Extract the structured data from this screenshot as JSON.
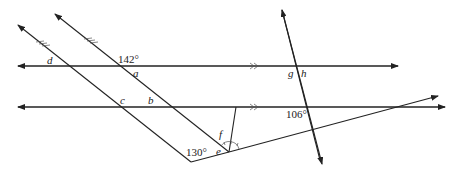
{
  "diagram": {
    "given_angles": {
      "top_intersection": "142°",
      "bottom_vertex": "130°",
      "right_transversal": "106°"
    },
    "labels": {
      "a": "a",
      "b": "b",
      "c": "c",
      "d": "d",
      "e": "e",
      "f": "f",
      "g": "g",
      "h": "h"
    },
    "marks": {
      "parallel_horizontal": "»",
      "parallel_diagonal": "two slanted tick marks"
    }
  }
}
